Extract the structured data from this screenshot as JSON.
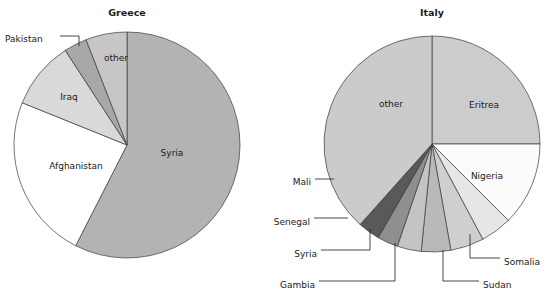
{
  "figure": {
    "background": "#ffffff",
    "outline_color": "#3a3a3a",
    "text_color": "#1a1a1a"
  },
  "charts": [
    {
      "id": "greece",
      "title": "Greece",
      "type": "pie",
      "center": [
        127,
        145
      ],
      "radius": 113,
      "start_angle_deg": 0,
      "direction": "clockwise",
      "slices": [
        {
          "label": "Syria",
          "percent": 57.5,
          "color": "#b3b3b3",
          "label_pos": [
            172,
            153
          ],
          "anchor": "middle",
          "callout": false
        },
        {
          "label": "Afghanistan",
          "percent": 23.6,
          "color": "#ffffff",
          "label_pos": [
            76,
            166
          ],
          "anchor": "middle",
          "callout": false
        },
        {
          "label": "Iraq",
          "percent": 9.7,
          "color": "#d9d9d9",
          "label_pos": [
            69,
            97
          ],
          "anchor": "middle",
          "callout": false
        },
        {
          "label": "Pakistan",
          "percent": 3.3,
          "color": "#a8a8a8",
          "label_pos": [
            5,
            39
          ],
          "anchor": "start",
          "callout": true,
          "leader": "M 60,36 L 79,36 L 79,46"
        },
        {
          "label": "other",
          "percent": 5.9,
          "color": "#c6c6c6",
          "label_pos": [
            116,
            58
          ],
          "anchor": "middle",
          "callout": false
        }
      ]
    },
    {
      "id": "italy",
      "title": "Italy",
      "type": "pie",
      "center": [
        432,
        144
      ],
      "radius": 108,
      "start_angle_deg": 0,
      "direction": "clockwise",
      "slices": [
        {
          "label": "Eritrea",
          "percent": 25.0,
          "color": "#cccccc",
          "label_pos": [
            484,
            105
          ],
          "anchor": "middle",
          "callout": false
        },
        {
          "label": "Nigeria",
          "percent": 12.5,
          "color": "#fbfbfb",
          "label_pos": [
            487,
            176
          ],
          "anchor": "middle",
          "callout": false
        },
        {
          "label": "Somalia",
          "percent": 4.7,
          "color": "#e6e6e6",
          "label_pos": [
            504,
            262
          ],
          "anchor": "start",
          "callout": true,
          "leader": "M 470,234 L 470,258 L 500,258"
        },
        {
          "label": "Sudan",
          "percent": 5.0,
          "color": "#cfcfcf",
          "label_pos": [
            483,
            285
          ],
          "anchor": "start",
          "callout": true,
          "leader": "M 443,250 L 443,281 L 479,281"
        },
        {
          "label": "Gambia",
          "percent": 4.4,
          "color": "#b9b9b9",
          "label_pos": [
            315,
            285
          ],
          "anchor": "end",
          "callout": true,
          "leader": "M 395,243 L 395,281 L 319,281"
        },
        {
          "label": "Syria",
          "percent": 3.6,
          "color": "#c4c4c4",
          "label_pos": [
            317,
            254
          ],
          "anchor": "end",
          "callout": true,
          "leader": "M 370,229 L 370,250 L 321,250"
        },
        {
          "label": "Senegal",
          "percent": 3.1,
          "color": "#8f8f8f",
          "label_pos": [
            310,
            222
          ],
          "anchor": "end",
          "callout": true,
          "leader": "M 348,218 L 314,218"
        },
        {
          "label": "Mali",
          "percent": 3.3,
          "color": "#595959",
          "label_pos": [
            311,
            182
          ],
          "anchor": "end",
          "callout": true,
          "leader": "M 334,179 L 315,179"
        },
        {
          "label": "other",
          "percent": 38.4,
          "color": "#cbcbcb",
          "label_pos": [
            391,
            104
          ],
          "anchor": "middle",
          "callout": false
        }
      ]
    }
  ],
  "chart_data": {
    "type": "pie",
    "subtitle": "",
    "xlabel": "",
    "ylabel": "",
    "grid": false,
    "legend": "none (direct labels with leader lines)",
    "panels": [
      {
        "title": "Greece",
        "type": "pie",
        "categories": [
          "Syria",
          "Afghanistan",
          "Iraq",
          "Pakistan",
          "other"
        ],
        "values": [
          57.5,
          23.6,
          9.7,
          3.3,
          5.9
        ],
        "units": "percent",
        "colors": [
          "#b3b3b3",
          "#ffffff",
          "#d9d9d9",
          "#a8a8a8",
          "#c6c6c6"
        ]
      },
      {
        "title": "Italy",
        "type": "pie",
        "categories": [
          "Eritrea",
          "Nigeria",
          "Somalia",
          "Sudan",
          "Gambia",
          "Syria",
          "Senegal",
          "Mali",
          "other"
        ],
        "values": [
          25.0,
          12.5,
          4.7,
          5.0,
          4.4,
          3.6,
          3.1,
          3.3,
          38.4
        ],
        "units": "percent",
        "colors": [
          "#cccccc",
          "#fbfbfb",
          "#e6e6e6",
          "#cfcfcf",
          "#b9b9b9",
          "#c4c4c4",
          "#8f8f8f",
          "#595959",
          "#cbcbcb"
        ]
      }
    ]
  }
}
